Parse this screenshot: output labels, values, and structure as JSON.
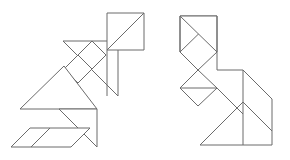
{
  "page": {
    "background_color": "#ffffff",
    "width": 290,
    "height": 160
  },
  "style": {
    "stroke_color": "#6b6b6b",
    "fill_color": "#ffffff",
    "stroke_width": 1
  },
  "figures": [
    {
      "name": "left-figure",
      "label": "Left tangram figure",
      "pieces": [
        {
          "name": "large-triangle-upper",
          "label": "Large triangle pointing right",
          "points": "63,41 118,41 118,96"
        },
        {
          "name": "small-triangle-top-right",
          "label": "Small triangle top right upper",
          "points": "107,13 144,13 107,50"
        },
        {
          "name": "small-triangle-top-right-lower",
          "label": "Small triangle top right lower",
          "points": "144,13 144,50 107,50"
        },
        {
          "name": "square-middle",
          "label": "Rotated square middle",
          "points": "78,55 92,41 106,55 92,69"
        },
        {
          "name": "small-triangle-middle",
          "label": "Small triangle below square",
          "points": "78,55 92,69 78,83"
        },
        {
          "name": "large-triangle-lower",
          "label": "Large triangle pointing up",
          "points": "20,109 75,109 47,81"
        },
        {
          "name": "medium-triangle-lower-right",
          "label": "Medium triangle lower right",
          "points": "97,109 97,147 59,109"
        },
        {
          "name": "parallelogram-bottom",
          "label": "Parallelogram bottom left",
          "points": "11,147 30,128 90,128 71,147"
        }
      ],
      "strokes": [
        {
          "name": "edge-l1",
          "d": "M 63,41 L 118,41"
        },
        {
          "name": "edge-l2",
          "d": "M 118,41 L 118,96"
        },
        {
          "name": "edge-l3",
          "d": "M 118,96 L 63,41"
        },
        {
          "name": "edge-l4",
          "d": "M 107,13 L 144,13"
        },
        {
          "name": "edge-l5",
          "d": "M 144,13 L 144,50"
        },
        {
          "name": "edge-l6",
          "d": "M 144,50 L 107,50"
        },
        {
          "name": "edge-l7",
          "d": "M 107,50 L 107,96"
        },
        {
          "name": "edge-l8",
          "d": "M 107,13 L 144,50"
        },
        {
          "name": "edge-l9",
          "d": "M 78,55 L 92,41"
        },
        {
          "name": "edge-l10",
          "d": "M 92,41 L 106,55"
        },
        {
          "name": "edge-l11",
          "d": "M 106,55 L 92,69"
        },
        {
          "name": "edge-l12",
          "d": "M 92,69 L 78,55"
        },
        {
          "name": "edge-l13",
          "d": "M 78,55 L 64,69"
        },
        {
          "name": "edge-l14",
          "d": "M 64,69 L 78,83"
        },
        {
          "name": "edge-l15",
          "d": "M 78,83 L 92,69"
        },
        {
          "name": "edge-l16",
          "d": "M 20,109 L 97,109"
        },
        {
          "name": "edge-l17",
          "d": "M 20,109 L 64,66"
        },
        {
          "name": "edge-l18",
          "d": "M 97,109 L 97,147"
        },
        {
          "name": "edge-l19",
          "d": "M 97,147 L 59,109"
        },
        {
          "name": "edge-l20",
          "d": "M 11,147 L 30,128"
        },
        {
          "name": "edge-l21",
          "d": "M 30,128 L 90,128"
        },
        {
          "name": "edge-l22",
          "d": "M 90,128 L 71,147"
        },
        {
          "name": "edge-l23",
          "d": "M 71,147 L 11,147"
        },
        {
          "name": "edge-l24",
          "d": "M 30,128 L 11,147"
        },
        {
          "name": "edge-l25",
          "d": "M 50,128 L 31,147"
        }
      ]
    },
    {
      "name": "right-figure",
      "label": "Right tangram figure",
      "strokes": [
        {
          "name": "edge-r1",
          "d": "M 180,16 L 180,52"
        },
        {
          "name": "edge-r2",
          "d": "M 180,16 L 217,52"
        },
        {
          "name": "edge-r3",
          "d": "M 217,16 L 217,70"
        },
        {
          "name": "edge-r4",
          "d": "M 217,16 L 180,52"
        },
        {
          "name": "edge-r5",
          "d": "M 180,52 L 198,70"
        },
        {
          "name": "edge-r6",
          "d": "M 198,70 L 217,52"
        },
        {
          "name": "edge-r7",
          "d": "M 198,70 L 180,88"
        },
        {
          "name": "edge-r8",
          "d": "M 180,88 L 198,106"
        },
        {
          "name": "edge-r9",
          "d": "M 198,106 L 217,88"
        },
        {
          "name": "edge-r10",
          "d": "M 217,88 L 198,70"
        },
        {
          "name": "edge-r11",
          "d": "M 180,88 L 217,88"
        },
        {
          "name": "edge-r12",
          "d": "M 217,70 L 243,70"
        },
        {
          "name": "edge-r13",
          "d": "M 243,70 L 243,145"
        },
        {
          "name": "edge-r14",
          "d": "M 243,70 L 272,99"
        },
        {
          "name": "edge-r15",
          "d": "M 272,99 L 272,145"
        },
        {
          "name": "edge-r16",
          "d": "M 272,145 L 243,145"
        },
        {
          "name": "edge-r17",
          "d": "M 243,145 L 200,145"
        },
        {
          "name": "edge-r18",
          "d": "M 200,145 L 243,102"
        },
        {
          "name": "edge-r19",
          "d": "M 243,102 L 272,131"
        },
        {
          "name": "edge-r20",
          "d": "M 217,88 L 243,114"
        }
      ]
    }
  ]
}
